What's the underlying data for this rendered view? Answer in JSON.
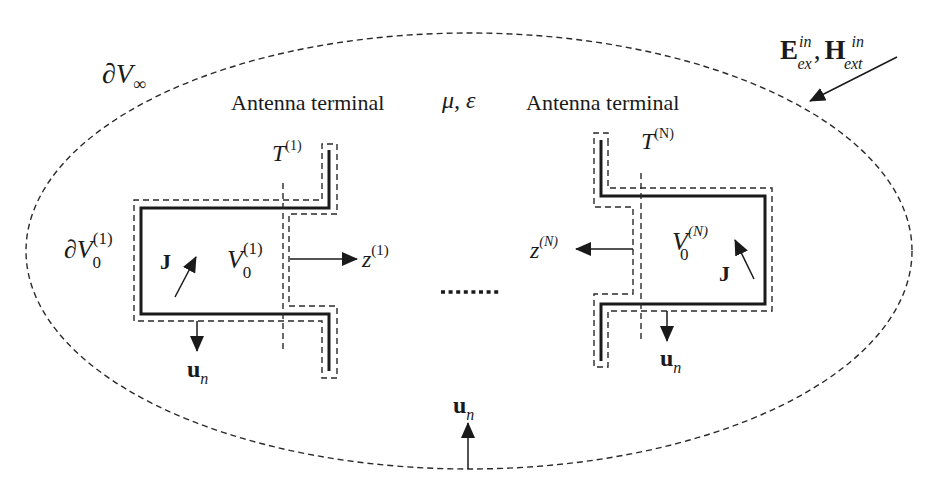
{
  "diagram": {
    "boundary_label": {
      "main": "∂V",
      "sub": "∞"
    },
    "medium_label": "μ, ε",
    "incident_field": {
      "E": "E",
      "E_sub": "ex",
      "E_sup": "in",
      "sep": ",",
      "H": "H",
      "H_sub": "ext",
      "H_sup": "in"
    },
    "antenna_1": {
      "terminal_label": "Antenna terminal",
      "T_main": "T",
      "T_sup": "(1)",
      "surface_main": "∂V",
      "surface_sub": "0",
      "surface_sup": "(1)",
      "volume_main": "V",
      "volume_sub": "0",
      "volume_sup": "(1)",
      "current": "J",
      "z_main": "z",
      "z_sup": "(1)",
      "normal_main": "u",
      "normal_sub": "n"
    },
    "ellipsis": "........",
    "antenna_N": {
      "terminal_label": "Antenna terminal",
      "T_main": "T",
      "T_sup": "(N)",
      "volume_main": "V",
      "volume_sub": "0",
      "volume_sup": "(N)",
      "current": "J",
      "z_main": "z",
      "z_sup": "(N)",
      "normal_main": "u",
      "normal_sub": "n"
    },
    "outer_normal": {
      "main": "u",
      "sub": "n"
    }
  }
}
